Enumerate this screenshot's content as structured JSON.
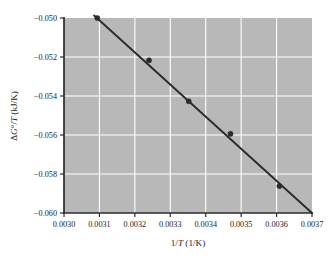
{
  "chart_data": {
    "type": "scatter",
    "title": "",
    "subtitle": "",
    "xlabel": "1/T (1/K)",
    "xlabel_parts": {
      "pre": "1/",
      "ital": "T",
      "post": " (1/K)"
    },
    "ylabel": "ΔG°/T (kJ/K)",
    "ylabel_parts": {
      "pre": "Δ",
      "ital1": "G",
      "mid": "°/",
      "ital2": "T",
      "post": " (kJ/K)"
    },
    "xlim": [
      0.003,
      0.0037
    ],
    "ylim": [
      -0.06,
      -0.05
    ],
    "xticks": [
      0.003,
      0.0031,
      0.0032,
      0.0033,
      0.0034,
      0.0035,
      0.0036,
      0.0037
    ],
    "xtick_labels": [
      "0.0030",
      "0.0031",
      "0.0032",
      "0.0033",
      "0.0034",
      "0.0035",
      "0.0036",
      "0.0037"
    ],
    "yticks": [
      -0.05,
      -0.052,
      -0.054,
      -0.056,
      -0.058,
      -0.06
    ],
    "ytick_labels": [
      "−0.050",
      "−0.052",
      "−0.054",
      "−0.056",
      "−0.058",
      "−0.060"
    ],
    "grid": true,
    "grid_color": "#ffffff",
    "plot_bg_color": "#b8b8b8",
    "axis_color": "#2b2b2b",
    "marker_color": "#2b2b2b",
    "line_color": "#2b2b2b",
    "legend": null,
    "legend_position": "none",
    "series": [
      {
        "name": "data points",
        "type": "scatter",
        "marker": "circle",
        "x": [
          0.003094,
          0.00324,
          0.003352,
          0.00347,
          0.003608
        ],
        "y": [
          -0.05,
          -0.05217,
          -0.05427,
          -0.05594,
          -0.05862
        ]
      },
      {
        "name": "linear fit",
        "type": "line",
        "x": [
          0.003085,
          0.0037
        ],
        "y": [
          -0.04987,
          -0.06
        ],
        "slope": -16.47,
        "intercept": 0.001
      }
    ]
  }
}
